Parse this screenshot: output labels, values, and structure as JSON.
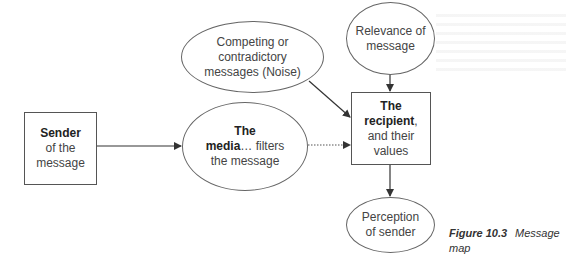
{
  "diagram": {
    "nodes": {
      "sender": {
        "bold": "Sender",
        "rest_1": "of the",
        "rest_2": "message"
      },
      "noise": {
        "line_1": "Competing or",
        "line_2": "contradictory",
        "line_3": "messages (Noise)"
      },
      "media": {
        "bold_1": "The",
        "bold_2": "media",
        "rest_1": "… filters",
        "rest_2": "the message"
      },
      "relevance": {
        "line_1": "Relevance of",
        "line_2": "message"
      },
      "recipient": {
        "bold_1": "The",
        "bold_2": "recipient",
        "rest_1": ",",
        "rest_2": "and their",
        "rest_3": "values"
      },
      "perception": {
        "line_1": "Perception",
        "line_2": "of sender"
      }
    },
    "edges": [
      {
        "from": "sender",
        "to": "media",
        "style": "solid"
      },
      {
        "from": "media",
        "to": "recipient",
        "style": "dotted"
      },
      {
        "from": "noise",
        "to": "recipient",
        "style": "solid"
      },
      {
        "from": "relevance",
        "to": "recipient",
        "style": "solid"
      },
      {
        "from": "recipient",
        "to": "perception",
        "style": "solid"
      }
    ]
  },
  "caption": {
    "number": "Figure 10.3",
    "title_1": "Message",
    "title_2": "map"
  }
}
